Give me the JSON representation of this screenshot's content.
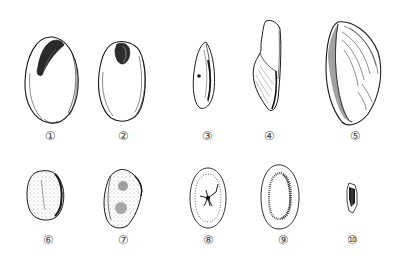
{
  "plate": {
    "background": "#ffffff",
    "ink_color": "#1a1a1a",
    "stipple_color": "#333333"
  },
  "figures": [
    {
      "id": 1,
      "label": "①",
      "description": "oval seed with dark curved hilum at top-left"
    },
    {
      "id": 2,
      "label": "②",
      "description": "obovate seed with dark notch at top"
    },
    {
      "id": 3,
      "label": "③",
      "description": "narrow lanceolate seed, side view with dot"
    },
    {
      "id": 4,
      "label": "④",
      "description": "elongated wedge-shaped seed with hatched base"
    },
    {
      "id": 5,
      "label": "⑤",
      "description": "large curved ribbed seed with stippled edge"
    },
    {
      "id": 6,
      "label": "⑥",
      "description": "rounded stippled seed with dark right margin"
    },
    {
      "id": 7,
      "label": "⑦",
      "description": "ovate stippled seed with angular right side"
    },
    {
      "id": 8,
      "label": "⑧",
      "description": "elliptic seed with dotted inner ring and star-shaped center"
    },
    {
      "id": 9,
      "label": "⑨",
      "description": "oval seed with stippled inner ring"
    },
    {
      "id": 10,
      "label": "⑩",
      "description": "small dark angular seed fragment"
    }
  ]
}
